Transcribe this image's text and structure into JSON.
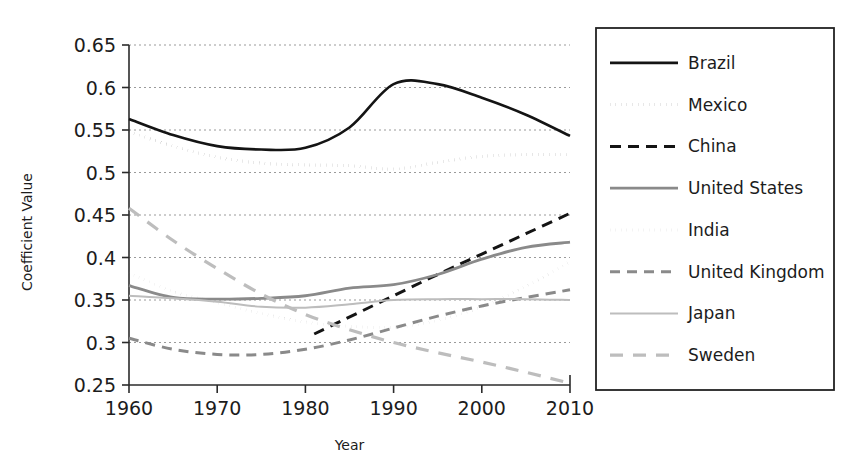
{
  "chart_data": {
    "type": "line",
    "title": "",
    "xlabel": "Year",
    "ylabel": "Coefficient Value",
    "xlim": [
      1960,
      2010
    ],
    "ylim": [
      0.25,
      0.65
    ],
    "xticks": [
      1960,
      1970,
      1980,
      1990,
      2000,
      2010
    ],
    "xticklabels": [
      "1960",
      "1970",
      "1980",
      "1990",
      "2000",
      "2010"
    ],
    "yticks": [
      0.25,
      0.3,
      0.35,
      0.4,
      0.45,
      0.5,
      0.55,
      0.6,
      0.65
    ],
    "yticklabels": [
      "0.25",
      "0.3",
      "0.35",
      "0.4",
      "0.45",
      "0.5",
      "0.55",
      "0.6",
      "0.65"
    ],
    "grid": true,
    "grid_axis": "y",
    "legend_position": "right-outside",
    "x": [
      1960,
      1965,
      1970,
      1975,
      1980,
      1985,
      1990,
      1995,
      2000,
      2005,
      2010
    ],
    "series": [
      {
        "name": "Brazil",
        "style": "solid",
        "color": "#141414",
        "width": 2.6,
        "dash": "none",
        "values": [
          0.563,
          0.544,
          0.531,
          0.527,
          0.529,
          0.553,
          0.604,
          0.604,
          0.588,
          0.568,
          0.543
        ]
      },
      {
        "name": "Mexico",
        "style": "dotted",
        "color": "#141414",
        "width": 3.2,
        "dash": "0.1 5.5",
        "values": [
          0.548,
          0.531,
          0.518,
          0.511,
          0.509,
          0.508,
          0.504,
          0.512,
          0.519,
          0.521,
          0.521
        ]
      },
      {
        "name": "China",
        "style": "dashed",
        "color": "#141414",
        "width": 3.0,
        "dash": "11 7",
        "start_year": 1981,
        "values": [
          null,
          null,
          null,
          null,
          0.31,
          0.33,
          0.355,
          0.38,
          0.404,
          0.428,
          0.452
        ]
      },
      {
        "name": "United States",
        "style": "solid",
        "color": "#8a8a8a",
        "width": 2.8,
        "dash": "none",
        "values": [
          0.367,
          0.353,
          0.351,
          0.352,
          0.355,
          0.364,
          0.368,
          0.38,
          0.398,
          0.412,
          0.418
        ]
      },
      {
        "name": "India",
        "style": "dotted",
        "color": "#8a8a8a",
        "width": 3.0,
        "dash": "0.1 5.5",
        "values": [
          0.382,
          0.36,
          0.347,
          0.334,
          0.324,
          0.319,
          0.318,
          0.326,
          0.342,
          0.366,
          0.395
        ]
      },
      {
        "name": "United Kingdom",
        "style": "dashed",
        "color": "#8a8a8a",
        "width": 3.0,
        "dash": "10 7",
        "values": [
          0.305,
          0.292,
          0.286,
          0.286,
          0.292,
          0.303,
          0.317,
          0.331,
          0.343,
          0.353,
          0.362
        ]
      },
      {
        "name": "Japan",
        "style": "solid",
        "color": "#bdbdbd",
        "width": 2.0,
        "dash": "none",
        "values": [
          0.355,
          0.352,
          0.348,
          0.342,
          0.341,
          0.345,
          0.35,
          0.351,
          0.351,
          0.351,
          0.35
        ]
      },
      {
        "name": "Sweden",
        "style": "long-dash",
        "color": "#bdbdbd",
        "width": 3.2,
        "dash": "13 10",
        "values": [
          0.458,
          0.42,
          0.387,
          0.357,
          0.333,
          0.315,
          0.3,
          0.288,
          0.277,
          0.265,
          0.252
        ]
      }
    ]
  },
  "legend": {
    "entries": [
      {
        "label": "Brazil"
      },
      {
        "label": "Mexico"
      },
      {
        "label": "China"
      },
      {
        "label": "United States"
      },
      {
        "label": "India"
      },
      {
        "label": "United Kingdom"
      },
      {
        "label": "Japan"
      },
      {
        "label": "Sweden"
      }
    ]
  }
}
